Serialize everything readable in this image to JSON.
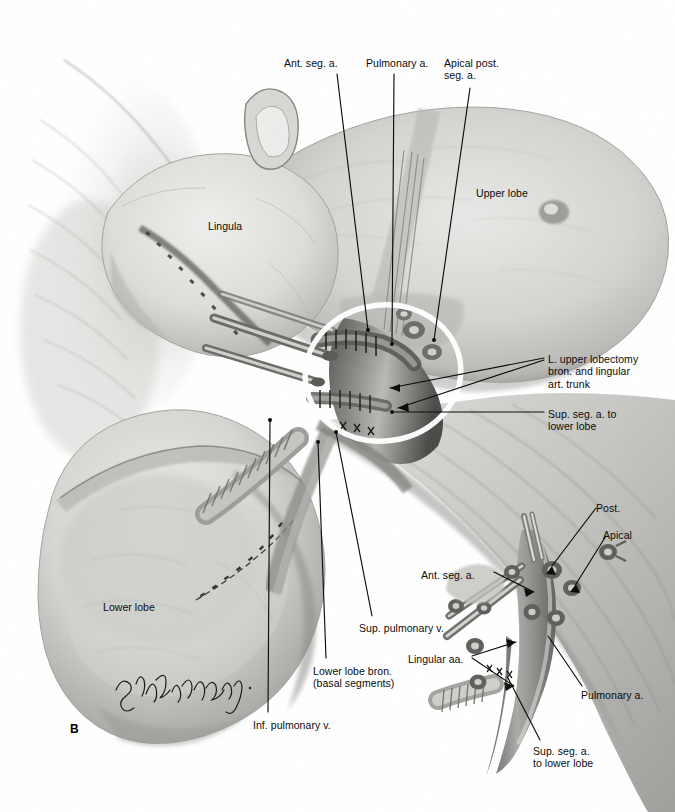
{
  "plate": {
    "panel_letter": "B",
    "artist_signature": "Leon Schlossberg",
    "background_color": "#ffffff",
    "ink_color": "#0b0b0b",
    "highlight_ring_color": "#ffffff"
  },
  "labels": {
    "ant_seg_a_top": "Ant. seg. a.",
    "pulmonary_a_top": "Pulmonary a.",
    "apical_post_seg_a": "Apical post.\nseg. a.",
    "lingula": "Lingula",
    "upper_lobe": "Upper lobe",
    "upper_lobectomy_trunk": "L. upper lobectomy\nbron. and lingular\nart. trunk",
    "sup_seg_a_lower_lobe_main": "Sup. seg. a. to\nlower lobe",
    "lower_lobe": "Lower lobe",
    "sup_pulmonary_v": "Sup. pulmonary v.",
    "lower_lobe_bron": "Lower lobe bron.\n(basal segments)",
    "inf_pulmonary_v": "Inf. pulmonary v.",
    "inset_post": "Post.",
    "inset_apical": "Apical",
    "inset_ant_seg_a": "Ant. seg. a.",
    "inset_lingular_aa": "Lingular aa.",
    "inset_pulmonary_a": "Pulmonary a.",
    "inset_sup_seg_a": "Sup. seg. a.\nto lower lobe"
  },
  "label_positions": {
    "ant_seg_a_top": {
      "x": 284,
      "y": 57,
      "align": "left"
    },
    "pulmonary_a_top": {
      "x": 366,
      "y": 57,
      "align": "left"
    },
    "apical_post_seg_a": {
      "x": 444,
      "y": 57,
      "align": "left"
    },
    "lingula": {
      "x": 208,
      "y": 220,
      "align": "left"
    },
    "upper_lobe": {
      "x": 476,
      "y": 187,
      "align": "left"
    },
    "upper_lobectomy_trunk": {
      "x": 548,
      "y": 353,
      "align": "left"
    },
    "sup_seg_a_lower_lobe_main": {
      "x": 548,
      "y": 408,
      "align": "left"
    },
    "lower_lobe": {
      "x": 103,
      "y": 601,
      "align": "left"
    },
    "sup_pulmonary_v": {
      "x": 359,
      "y": 622,
      "align": "left"
    },
    "lower_lobe_bron": {
      "x": 313,
      "y": 665,
      "align": "left"
    },
    "inf_pulmonary_v": {
      "x": 253,
      "y": 719,
      "align": "left"
    },
    "inset_post": {
      "x": 596,
      "y": 502,
      "align": "left"
    },
    "inset_apical": {
      "x": 603,
      "y": 529,
      "align": "left"
    },
    "inset_ant_seg_a": {
      "x": 421,
      "y": 569,
      "align": "left"
    },
    "inset_lingular_aa": {
      "x": 408,
      "y": 653,
      "align": "left"
    },
    "inset_pulmonary_a": {
      "x": 581,
      "y": 689,
      "align": "left"
    },
    "inset_sup_seg_a": {
      "x": 533,
      "y": 745,
      "align": "left"
    },
    "panel_letter": {
      "x": 70,
      "y": 722,
      "align": "left"
    }
  },
  "illustration": {
    "subject": "left lung hilum, upper lobectomy, intraoperative view",
    "main_structures": [
      "upper lobe",
      "lingula",
      "lower lobe",
      "pulmonary artery",
      "superior pulmonary vein",
      "inferior pulmonary vein",
      "lower lobe bronchus"
    ],
    "highlight_ring": {
      "cx": 383,
      "cy": 373,
      "rx": 78,
      "ry": 68
    },
    "inset": {
      "title_hidden": true,
      "structures": [
        "pulmonary artery trunk",
        "ligated segmental stumps",
        "bronchus"
      ]
    }
  }
}
